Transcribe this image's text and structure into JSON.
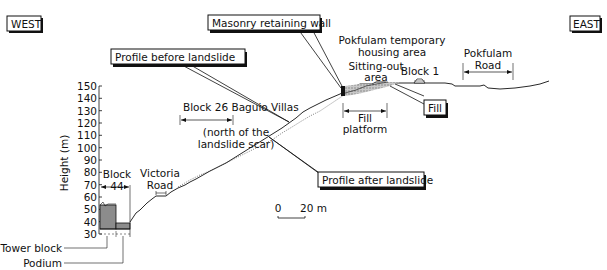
{
  "compass": {
    "west": "WEST",
    "east": "EAST"
  },
  "callouts": {
    "profile_before": "Profile before landslide",
    "profile_after": "Profile after landslide",
    "masonry_wall": "Masonry retaining wall",
    "fill": "Fill"
  },
  "labels": {
    "block26_line1": "Block 26 Baguio Villas",
    "block26_line2": "(north of the",
    "block26_line3": "landslide scar)",
    "block44_line1": "Block",
    "block44_line2": "44",
    "victoria_line1": "Victoria",
    "victoria_line2": "Road",
    "pokfulam_area_line1": "Pokfulam temporary",
    "pokfulam_area_line2": "housing area",
    "sitting_line1": "Sitting-out",
    "sitting_line2": "area",
    "block1": "Block 1",
    "pokfulam_road_line1": "Pokfulam",
    "pokfulam_road_line2": "Road",
    "fill_platform_line1": "Fill",
    "fill_platform_line2": "platform",
    "tower_block": "Tower block",
    "podium": "Podium"
  },
  "axis": {
    "label": "Height (m)",
    "ticks": [
      "150",
      "140",
      "130",
      "120",
      "110",
      "100",
      "90",
      "80",
      "70",
      "60",
      "50",
      "40",
      "30"
    ]
  },
  "scale_bar": {
    "start": "0",
    "end": "20 m"
  },
  "colors": {
    "line": "#111111",
    "fill_grey": "#8c8c8c",
    "fill_hatch": "#a0a0a0"
  }
}
